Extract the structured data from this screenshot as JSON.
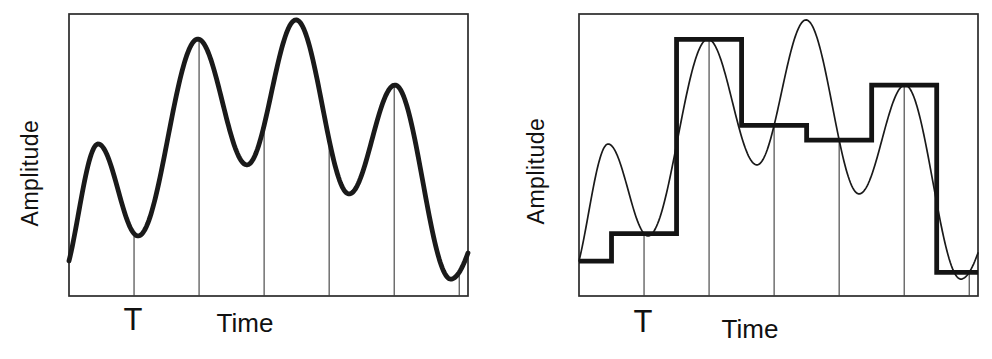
{
  "figure": {
    "background_color": "#ffffff",
    "ink_color": "#1a1a1a",
    "sample_line_color": "#3c3c3c"
  },
  "chart_data": [
    {
      "type": "line",
      "title": "",
      "xlabel": "Time",
      "ylabel": "Amplitude",
      "sampling_interval_label": "T",
      "x_range": [
        0,
        1
      ],
      "y_range": [
        0,
        1
      ],
      "grid": false,
      "legend": false,
      "sampling_interval": 0.163,
      "sample_times": [
        0.163,
        0.326,
        0.489,
        0.652,
        0.815,
        0.978
      ],
      "sample_values": [
        0.221,
        0.91,
        0.605,
        0.553,
        0.748,
        0.084
      ],
      "waveform_control_points": [
        [
          -0.025,
          0.05
        ],
        [
          0.073,
          0.539
        ],
        [
          0.173,
          0.213
        ],
        [
          0.323,
          0.911
        ],
        [
          0.446,
          0.465
        ],
        [
          0.569,
          0.979
        ],
        [
          0.702,
          0.362
        ],
        [
          0.817,
          0.748
        ],
        [
          0.957,
          0.06
        ],
        [
          1.08,
          0.4
        ]
      ],
      "series": [
        {
          "name": "analog_waveform",
          "style": "thick-line"
        },
        {
          "name": "sampling_instants",
          "style": "thin-vertical-lines"
        }
      ]
    },
    {
      "type": "line",
      "title": "",
      "xlabel": "Time",
      "ylabel": "Amplitude",
      "sampling_interval_label": "T",
      "x_range": [
        0,
        1
      ],
      "y_range": [
        0,
        1
      ],
      "grid": false,
      "legend": false,
      "sampling_interval": 0.163,
      "sample_times": [
        0.163,
        0.326,
        0.489,
        0.652,
        0.815,
        0.978
      ],
      "hold_levels": [
        0.124,
        0.221,
        0.91,
        0.605,
        0.553,
        0.748,
        0.084
      ],
      "step_edge_times": [
        0.0815,
        0.2445,
        0.4075,
        0.5705,
        0.7335,
        0.8965
      ],
      "waveform_control_points": [
        [
          -0.025,
          0.05
        ],
        [
          0.073,
          0.539
        ],
        [
          0.173,
          0.213
        ],
        [
          0.323,
          0.911
        ],
        [
          0.446,
          0.465
        ],
        [
          0.569,
          0.979
        ],
        [
          0.702,
          0.362
        ],
        [
          0.817,
          0.748
        ],
        [
          0.957,
          0.06
        ],
        [
          1.08,
          0.4
        ]
      ],
      "series": [
        {
          "name": "analog_waveform",
          "style": "thin-line"
        },
        {
          "name": "sample_and_hold_output",
          "style": "thick-staircase"
        },
        {
          "name": "sampling_instants",
          "style": "thin-vertical-lines"
        }
      ]
    }
  ]
}
